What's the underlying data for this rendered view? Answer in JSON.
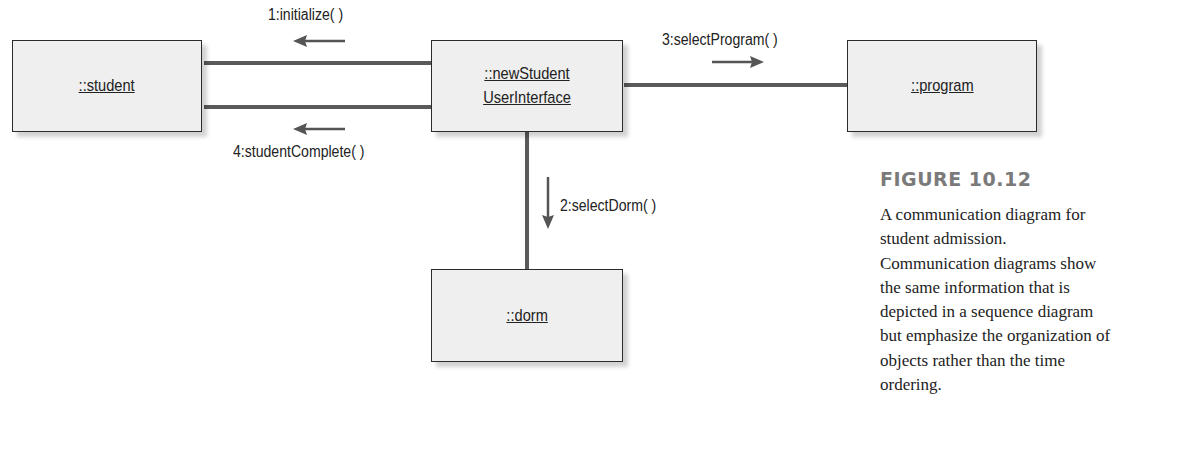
{
  "diagram": {
    "type": "communication-diagram",
    "objects": {
      "student": {
        "label": "::student"
      },
      "ui": {
        "label_line1": "::newStudent",
        "label_line2": "UserInterface"
      },
      "program": {
        "label": "::program"
      },
      "dorm": {
        "label": "::dorm"
      }
    },
    "messages": {
      "m1": {
        "label": "1:initialize( )",
        "direction": "left",
        "from": "::newStudent UserInterface",
        "to": "::student"
      },
      "m2": {
        "label": "2:selectDorm( )",
        "direction": "down",
        "from": "::newStudent UserInterface",
        "to": "::dorm"
      },
      "m3": {
        "label": "3:selectProgram( )",
        "direction": "right",
        "from": "::newStudent UserInterface",
        "to": "::program"
      },
      "m4": {
        "label": "4:studentComplete( )",
        "direction": "left",
        "from": "::newStudent UserInterface",
        "to": "::student"
      }
    },
    "colors": {
      "box_fill": "#efefef",
      "box_border": "#2b2b2b",
      "link": "#5a5a5a",
      "figure_title": "#7a7a7a"
    }
  },
  "figure": {
    "title": "FIGURE 10.12",
    "caption_lines": [
      "A communication diagram for",
      "student admission.",
      "Communication diagrams show",
      "the same information that is",
      "depicted in a sequence diagram",
      "but emphasize the organization of",
      "objects rather than the time",
      "ordering."
    ]
  }
}
